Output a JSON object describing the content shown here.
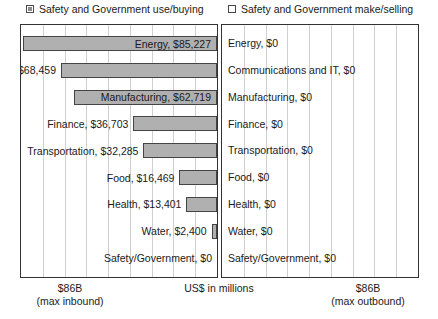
{
  "legend": {
    "inbound": {
      "label": "Safety and Government use/buying",
      "marker": "filled-square-icon",
      "color": "#b0b0b0"
    },
    "outbound": {
      "label": "Safety and Government make/selling",
      "marker": "hollow-square-icon",
      "color": "#ffffff"
    }
  },
  "axis": {
    "left_line1": "$86B",
    "left_line2": "(max inbound)",
    "center_line1": "US$ in millions",
    "center_line2": "",
    "right_line1": "$86B",
    "right_line2": "(max outbound)"
  },
  "chart_data": {
    "type": "bar",
    "title": "",
    "subtitle": "",
    "xlabel": "US$ in millions",
    "ylabel": "",
    "orientation": "horizontal",
    "layout": "bidirectional-pyramid",
    "grid": true,
    "legend_position": "top",
    "axis_max_label": "$86B",
    "axis_max_value": 86000,
    "xlim_left": [
      86000,
      0
    ],
    "xlim_right": [
      0,
      86000
    ],
    "categories": [
      "Energy",
      "Communications and IT",
      "Manufacturing",
      "Finance",
      "Transportation",
      "Food",
      "Health",
      "Water",
      "Safety/Government"
    ],
    "series": [
      {
        "name": "Safety and Government use/buying",
        "direction": "inbound",
        "color": "#b0b0b0",
        "values": [
          85227,
          68459,
          62719,
          36703,
          32285,
          16469,
          13401,
          2400,
          0
        ],
        "value_labels": [
          "Energy, $85,227",
          "Communications and IT, $68,459",
          "Manufacturing, $62,719",
          "Finance, $36,703",
          "Transportation, $32,285",
          "Food, $16,469",
          "Health, $13,401",
          "Water, $2,400",
          "Safety/Government,  $0"
        ]
      },
      {
        "name": "Safety and Government make/selling",
        "direction": "outbound",
        "color": "#ffffff",
        "values": [
          0,
          0,
          0,
          0,
          0,
          0,
          0,
          0,
          0
        ],
        "value_labels": [
          "Energy, $0",
          "Communications and IT, $0",
          "Manufacturing, $0",
          "Finance, $0",
          "Transportation, $0",
          "Food, $0",
          "Health, $0",
          "Water, $0",
          "Safety/Government, $0"
        ]
      }
    ]
  }
}
